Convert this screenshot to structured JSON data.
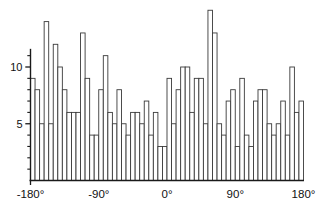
{
  "chart_data": {
    "type": "bar",
    "title": "",
    "subtitle": "",
    "xlabel": "",
    "ylabel": "",
    "grid": false,
    "legend": null,
    "xlim": [
      -180,
      180
    ],
    "ylim": [
      0,
      15
    ],
    "bin_width_deg": 6,
    "n_bins": 60,
    "x_tick_labels": [
      "-180°",
      "-90°",
      "0°",
      "90°",
      "180°"
    ],
    "x_tick_values": [
      -180,
      -90,
      0,
      90,
      180
    ],
    "y_tick_labels": [
      "5",
      "10"
    ],
    "y_tick_values": [
      5,
      10
    ],
    "y_minor_tick_values": [
      1,
      2,
      3,
      4,
      6,
      7,
      8,
      9,
      11
    ],
    "bin_left_edges": [
      -180,
      -174,
      -168,
      -162,
      -156,
      -150,
      -144,
      -138,
      -132,
      -126,
      -120,
      -114,
      -108,
      -102,
      -96,
      -90,
      -84,
      -78,
      -72,
      -66,
      -60,
      -54,
      -48,
      -42,
      -36,
      -30,
      -24,
      -18,
      -12,
      -6,
      0,
      6,
      12,
      18,
      24,
      30,
      36,
      42,
      48,
      54,
      60,
      66,
      72,
      78,
      84,
      90,
      96,
      102,
      108,
      114,
      120,
      126,
      132,
      138,
      144,
      150,
      156,
      162,
      168,
      174
    ],
    "bin_centers": [
      -177,
      -171,
      -165,
      -159,
      -153,
      -147,
      -141,
      -135,
      -129,
      -123,
      -117,
      -111,
      -105,
      -99,
      -93,
      -87,
      -81,
      -75,
      -69,
      -63,
      -57,
      -51,
      -45,
      -39,
      -33,
      -27,
      -21,
      -15,
      -9,
      -3,
      3,
      9,
      15,
      21,
      27,
      33,
      39,
      45,
      51,
      57,
      63,
      69,
      75,
      81,
      87,
      93,
      99,
      105,
      111,
      117,
      123,
      129,
      135,
      141,
      147,
      153,
      159,
      165,
      171,
      177
    ],
    "values": [
      9,
      8,
      5,
      14,
      5,
      12,
      10,
      8,
      6,
      6,
      6,
      13,
      9,
      4,
      4,
      8,
      11,
      6,
      5,
      8,
      5,
      4,
      6,
      6,
      5,
      7,
      4,
      6,
      3,
      3,
      9,
      5,
      8,
      10,
      10,
      6,
      9,
      9,
      5,
      15,
      13,
      5,
      4,
      7,
      8,
      3,
      9,
      4,
      3,
      7,
      8,
      8,
      5,
      4,
      5,
      7,
      4,
      10,
      6,
      7
    ],
    "categories": [
      "-177°",
      "-171°",
      "-165°",
      "-159°",
      "-153°",
      "-147°",
      "-141°",
      "-135°",
      "-129°",
      "-123°",
      "-117°",
      "-111°",
      "-105°",
      "-99°",
      "-93°",
      "-87°",
      "-81°",
      "-75°",
      "-69°",
      "-63°",
      "-57°",
      "-51°",
      "-45°",
      "-39°",
      "-33°",
      "-27°",
      "-21°",
      "-15°",
      "-9°",
      "-3°",
      "3°",
      "9°",
      "15°",
      "21°",
      "27°",
      "33°",
      "39°",
      "45°",
      "51°",
      "57°",
      "63°",
      "69°",
      "75°",
      "81°",
      "87°",
      "93°",
      "99°",
      "105°",
      "111°",
      "117°",
      "123°",
      "129°",
      "135°",
      "141°",
      "147°",
      "153°",
      "159°",
      "165°",
      "171°",
      "177°"
    ],
    "colors": {
      "bar_fill": "#ffffff",
      "bar_stroke": "#3a3a3a",
      "axis": "#1a1a1a",
      "text": "#111111",
      "background": "#ffffff"
    }
  },
  "axes": {
    "y_label_10": "10",
    "y_label_5": "5",
    "x_label_min180": "-180°",
    "x_label_min90": "-90°",
    "x_label_0": "0°",
    "x_label_90": "90°",
    "x_label_180": "180°"
  }
}
